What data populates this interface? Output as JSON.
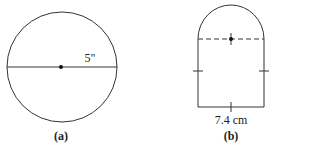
{
  "figure_a": {
    "measure_label": "5\"",
    "caption": "(a)"
  },
  "figure_b": {
    "measure_label": "7.4 cm",
    "caption": "(b)"
  },
  "colors": {
    "stroke": "#333333"
  }
}
